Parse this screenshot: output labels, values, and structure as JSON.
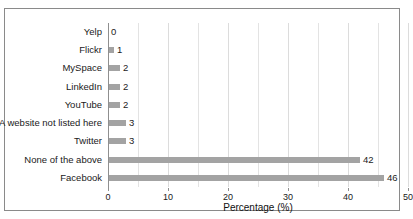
{
  "chart_data": {
    "type": "bar",
    "orientation": "horizontal",
    "title": "",
    "xlabel": "Percentage (%)",
    "ylabel": "",
    "xlim": [
      0,
      50
    ],
    "xticks": [
      0,
      10,
      20,
      30,
      40,
      50
    ],
    "xtick_labels": [
      "0",
      "10",
      "20",
      "30",
      "40",
      "50"
    ],
    "minor_gridlines_step": 5,
    "grid": true,
    "legend": null,
    "bar_color": "#a3a3a3",
    "categories": [
      "Yelp",
      "Flickr",
      "MySpace",
      "LinkedIn",
      "YouTube",
      "A website not listed here",
      "Twitter",
      "None of the above",
      "Facebook"
    ],
    "values": [
      0,
      1,
      2,
      2,
      2,
      3,
      3,
      42,
      46
    ],
    "data_labels": [
      "0",
      "1",
      "2",
      "2",
      "2",
      "3",
      "3",
      "42",
      "46"
    ]
  }
}
